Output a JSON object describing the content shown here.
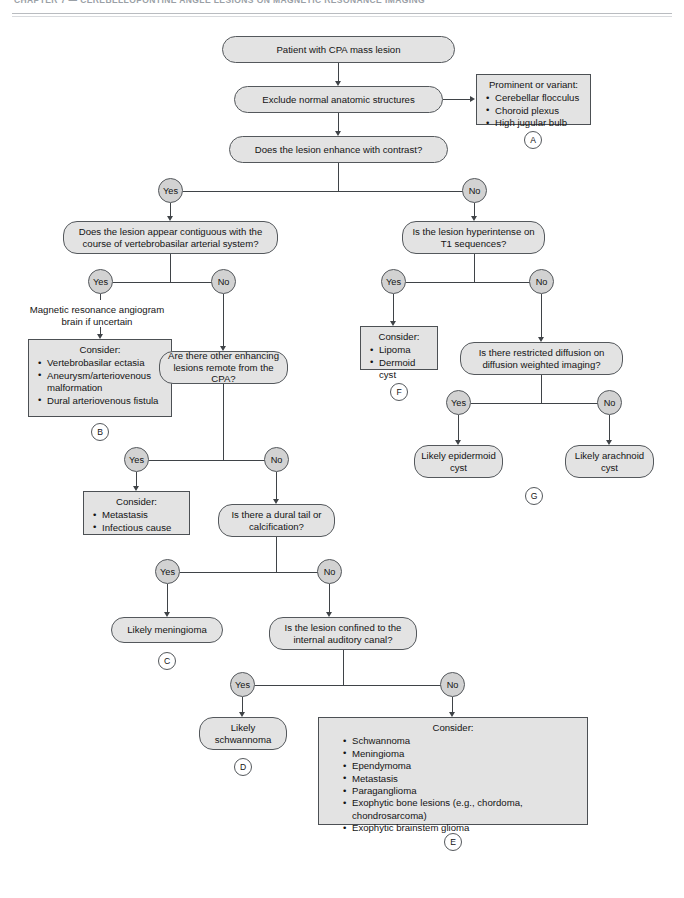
{
  "running_head": "CHAPTER 7  —  CEREBELLOPONTINE ANGLE LESIONS ON MAGNETIC RESONANCE IMAGING",
  "flowchart": {
    "title": "Patient with CPA mass lesion algorithm",
    "nodes": {
      "start": "Patient with CPA mass lesion",
      "exclude": "Exclude normal anatomic structures",
      "enhance": "Does the lesion enhance with contrast?",
      "contiguous": "Does the lesion appear contiguous with the course of vertebrobasilar arterial system?",
      "other_enhancing": "Are there other enhancing lesions remote from the CPA?",
      "dural_tail": "Is there a dural tail or calcification?",
      "confined_iac": "Is the lesion confined to the internal auditory canal?",
      "hyperintense_t1": "Is the lesion hyperintense on T1 sequences?",
      "restricted_diffusion": "Is there restricted diffusion on diffusion weighted imaging?",
      "likely_meningioma": "Likely meningioma",
      "likely_schwannoma": "Likely schwannoma",
      "likely_epidermoid": "Likely epidermoid cyst",
      "likely_arachnoid": "Likely arachnoid cyst"
    },
    "annotation": {
      "mra": "Magnetic resonance angiogram brain if uncertain"
    },
    "branch_labels": {
      "yes": "Yes",
      "no": "No"
    },
    "panels": {
      "A": {
        "key": "A",
        "title": "Prominent or variant:",
        "items": [
          "Cerebellar flocculus",
          "Choroid plexus",
          "High jugular bulb"
        ]
      },
      "B": {
        "key": "B",
        "title": "Consider:",
        "items": [
          "Vertebrobasilar ectasia",
          "Aneurysm/arteriovenous malformation",
          "Dural arteriovenous fistula"
        ]
      },
      "C": {
        "key": "C",
        "title": "Consider:",
        "items": [
          "Metastasis",
          "Infectious cause"
        ]
      },
      "D": {
        "key": "D"
      },
      "E": {
        "key": "E",
        "title": "Consider:",
        "items": [
          "Schwannoma",
          "Meningioma",
          "Ependymoma",
          "Metastasis",
          "Paraganglioma",
          "Exophytic bone lesions (e.g., chordoma, chondrosarcoma)",
          "Exophytic brainstem glioma"
        ]
      },
      "F": {
        "key": "F",
        "title": "Consider:",
        "items": [
          "Lipoma",
          "Dermoid cyst"
        ]
      },
      "G": {
        "key": "G"
      }
    },
    "colors": {
      "node_fill": "#e3e3e3",
      "node_stroke": "#54585c",
      "connector": "#3f4347",
      "page_background": "#ffffff"
    }
  }
}
